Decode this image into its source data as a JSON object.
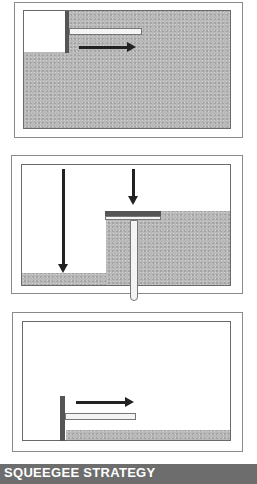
{
  "diagram": {
    "caption": "SQUEEGEE STRATEGY",
    "panels": [
      {
        "step": 1,
        "description": "Squeegee starts at top-left corner, horizontal stroke to the right",
        "direction": "right"
      },
      {
        "step": 2,
        "description": "Vertical downward strokes clearing the window",
        "direction": "down"
      },
      {
        "step": 3,
        "description": "Final horizontal stroke along the bottom edge",
        "direction": "right"
      }
    ],
    "colors": {
      "wet_area": "#b9b9b9",
      "caption_bar": "#6d6d6d",
      "caption_text": "#ffffff",
      "arrow": "#222222"
    }
  }
}
